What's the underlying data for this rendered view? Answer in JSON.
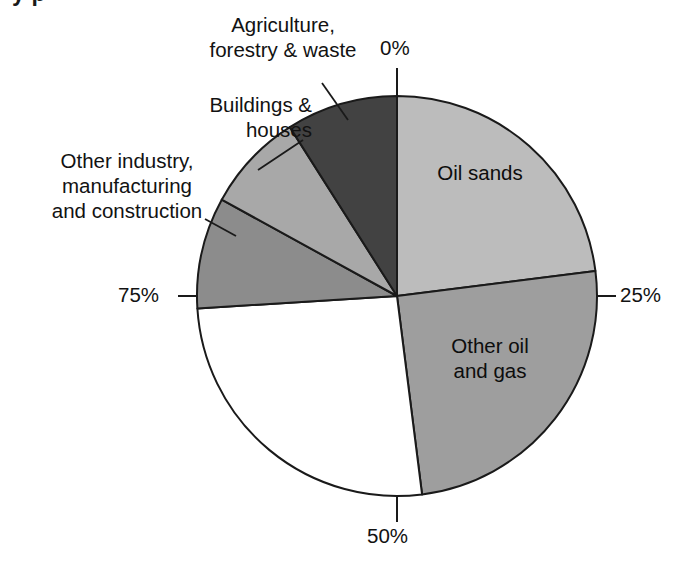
{
  "page": {
    "background_color": "#ffffff",
    "cropped_title_fragment": "y p"
  },
  "chart_data": {
    "type": "pie",
    "title": "",
    "subtitle": "",
    "xlabel": "",
    "ylabel": "",
    "grid": false,
    "legend_position": "none",
    "start_angle_deg": 0,
    "direction": "clockwise",
    "center": {
      "x": 397,
      "y": 296
    },
    "radius": 200,
    "axis_ticks": [
      "0%",
      "25%",
      "50%",
      "75%"
    ],
    "axis_tick_values": [
      0,
      25,
      50,
      75
    ],
    "categories": [
      "Oil sands",
      "Other oil and gas",
      "",
      "Other industry, manufacturing and construction",
      "Buildings & houses",
      "Agriculture, forestry & waste"
    ],
    "values": [
      23,
      25,
      26,
      9,
      8,
      9
    ],
    "slices": [
      {
        "label": "Oil sands",
        "value": 23,
        "start_pct": 0,
        "end_pct": 23,
        "color": "#bcbcbc",
        "label_placement": "inside"
      },
      {
        "label": "Other oil and gas",
        "value": 25,
        "start_pct": 23,
        "end_pct": 48,
        "color": "#9e9e9e",
        "label_placement": "inside"
      },
      {
        "label": "",
        "value": 26,
        "start_pct": 48,
        "end_pct": 74,
        "color": "#ffffff",
        "label_placement": "none"
      },
      {
        "label": "Other industry, manufacturing and construction",
        "value": 9,
        "start_pct": 74,
        "end_pct": 83,
        "color": "#8c8c8c",
        "label_placement": "callout"
      },
      {
        "label": "Buildings & houses",
        "value": 8,
        "start_pct": 83,
        "end_pct": 91,
        "color": "#a8a8a8",
        "label_placement": "callout"
      },
      {
        "label": "Agriculture, forestry & waste",
        "value": 9,
        "start_pct": 91,
        "end_pct": 100,
        "color": "#424242",
        "label_placement": "callout"
      }
    ]
  },
  "slice_labels": {
    "oil_sands": "Oil sands",
    "other_oil_and_gas": "Other oil\nand gas"
  },
  "callouts": {
    "agriculture": "Agriculture,\nforestry & waste",
    "buildings": "Buildings &\nhouses",
    "other_industry": "Other industry,\nmanufacturing\nand construction"
  },
  "ticks": {
    "top": "0%",
    "right": "25%",
    "bottom": "50%",
    "left": "75%"
  },
  "colors": {
    "outline": "#1a1a1a",
    "text": "#121212",
    "oil_sands": "#bcbcbc",
    "other_oil_and_gas": "#9e9e9e",
    "unlabeled_white": "#ffffff",
    "other_industry": "#8c8c8c",
    "buildings": "#a8a8a8",
    "agriculture": "#424242"
  }
}
